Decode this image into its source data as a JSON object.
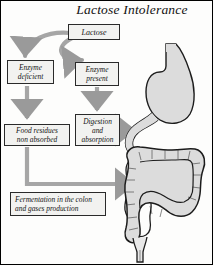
{
  "figure": {
    "title": "Lactose Intolerance",
    "type": "flowchart-anatomy-diagram",
    "border": "#000000",
    "background": "#fdfdfc"
  },
  "nodes": {
    "lactose": {
      "label": "Lactose"
    },
    "enzyme_deficient": {
      "line1": "Enzyme",
      "line2": "deficient"
    },
    "enzyme_present": {
      "line1": "Enzyme",
      "line2": "present"
    },
    "food_residues": {
      "line1": "Food residues",
      "line2": "non absorbed"
    },
    "digestion": {
      "line1": "Digestion",
      "line2": "and",
      "line3": "absorption"
    },
    "fermentation": {
      "line1": "Fermentation in the colon",
      "line2": "and gases production"
    }
  },
  "anatomy": {
    "stomach": "stomach-organ",
    "duodenum": "duodenum-organ",
    "colon": "large-intestine-organ",
    "rectum": "rectum-organ",
    "fill": "#d9d9d9",
    "outline": "#1a1a1a"
  },
  "arrows": {
    "color": "#9a9a9a",
    "lactose_to_enzyme_deficient": "curved-branch-arrow",
    "lactose_to_enzyme_present": "curved-branch-arrow",
    "enzyme_deficient_to_food_residues": "down-arrow",
    "enzyme_present_to_digestion": "down-arrow",
    "digestion_to_duodenum": "right-arrow",
    "food_residues_to_colon": "elbow-right-arrow"
  }
}
